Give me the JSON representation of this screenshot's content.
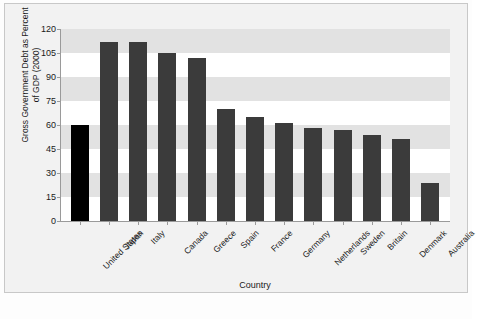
{
  "chart_data": {
    "type": "bar",
    "title": "",
    "xlabel": "Country",
    "ylabel": "Gross Government Debt as Percent of GDP (2000)",
    "ylabel_line1": "Gross Government Debt as Percent",
    "ylabel_line2": "of GDP (2000)",
    "categories": [
      "United States",
      "Japan",
      "Italy",
      "Canada",
      "Greece",
      "Spain",
      "France",
      "Germany",
      "Netherlands",
      "Sweden",
      "Britain",
      "Denmark",
      "Australia"
    ],
    "values": [
      60,
      112,
      112,
      105,
      102,
      70,
      65,
      61,
      58,
      57,
      54,
      51,
      24
    ],
    "ylim": [
      0,
      120
    ],
    "yticks": [
      0,
      15,
      30,
      45,
      60,
      75,
      90,
      105,
      120
    ],
    "ytick_labels": [
      "0",
      "15",
      "30",
      "45",
      "60",
      "75",
      "90",
      "105",
      "120"
    ],
    "grid": "horizontal-bands",
    "legend": "none",
    "highlight_index": 0,
    "colors": {
      "bar": "#3b3b3b",
      "highlight_bar": "#000000",
      "band": "#e2e2e2",
      "plot_background": "#ffffff",
      "figure_background": "#f2f2f2",
      "axis": "#9a9a9a",
      "text": "#1a1a1a"
    }
  },
  "caption": {
    "text": ""
  }
}
